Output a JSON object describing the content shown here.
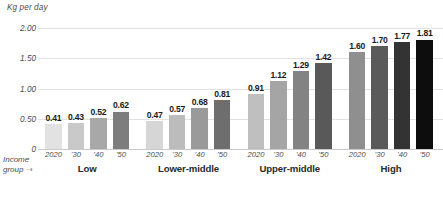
{
  "chart_data": {
    "type": "bar",
    "title": "",
    "ylabel": "Kg per day",
    "xlabel": "Income group",
    "ylim": [
      0,
      2.0
    ],
    "yticks": [
      "0",
      "0.50",
      "1.00",
      "1.50",
      "2.00"
    ],
    "ytick_values": [
      0,
      0.5,
      1.0,
      1.5,
      2.0
    ],
    "grid": true,
    "legend": "none",
    "categories": [
      "Low",
      "Lower-middle",
      "Upper-middle",
      "High"
    ],
    "x": [
      "2020",
      "'30",
      "'40",
      "'50"
    ],
    "series": [
      {
        "name": "Low",
        "values": [
          0.41,
          0.43,
          0.52,
          0.62
        ]
      },
      {
        "name": "Lower-middle",
        "values": [
          0.47,
          0.57,
          0.68,
          0.81
        ]
      },
      {
        "name": "Upper-middle",
        "values": [
          0.91,
          1.12,
          1.29,
          1.42
        ]
      },
      {
        "name": "High",
        "values": [
          1.6,
          1.7,
          1.77,
          1.81
        ]
      }
    ],
    "value_labels": [
      [
        "0.41",
        "0.43",
        "0.52",
        "0.62"
      ],
      [
        "0.47",
        "0.57",
        "0.68",
        "0.81"
      ],
      [
        "0.91",
        "1.12",
        "1.29",
        "1.42"
      ],
      [
        "1.60",
        "1.70",
        "1.77",
        "1.81"
      ]
    ],
    "bar_colors": [
      [
        "#e2e2e2",
        "#c9c9c9",
        "#a8a8a8",
        "#7d7d7d"
      ],
      [
        "#d6d6d6",
        "#bcbcbc",
        "#9a9a9a",
        "#6e6e6e"
      ],
      [
        "#bfbfbf",
        "#a5a5a5",
        "#838383",
        "#595959"
      ],
      [
        "#8f8f8f",
        "#5a5a5a",
        "#333333",
        "#0d0d0d"
      ]
    ]
  },
  "annotations": {
    "income_group_line1": "Income",
    "income_group_line2": "group",
    "arrow_glyph": "⇢"
  },
  "colors": {
    "background": "#ffffff",
    "gridline": "#e2e2e2",
    "baseline": "#c9c9c9",
    "axis_text": "#4c4c4c",
    "value_text": "#1a1a1a",
    "group_text": "#2a2a2a"
  }
}
